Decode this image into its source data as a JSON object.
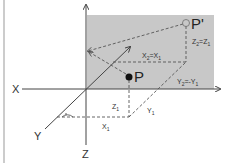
{
  "colors": {
    "plane_fill": "#c8c8c8",
    "axis": "#444444",
    "dash": "#555555",
    "border": "#bbbbbb",
    "point": "#111111"
  },
  "axes": {
    "x_label": "X",
    "y_label": "Y",
    "z_label": "Z"
  },
  "points": {
    "p_label": "P",
    "p_prime_label": "P'"
  },
  "labels": {
    "x1": {
      "base": "X",
      "sub": "1"
    },
    "y1": {
      "base": "Y",
      "sub": "1"
    },
    "z1": {
      "base": "Z",
      "sub": "1"
    },
    "x2_eq_x1": {
      "base": "X",
      "sub": "2",
      "eq": "=X",
      "sub2": "1"
    },
    "y2_eq_neg_y1": {
      "base": "Y",
      "sub": "2",
      "eq": "=-Y",
      "sub2": "1"
    },
    "z2_eq_z1": {
      "base": "Z",
      "sub": "2",
      "eq": "=Z",
      "sub2": "1"
    }
  }
}
